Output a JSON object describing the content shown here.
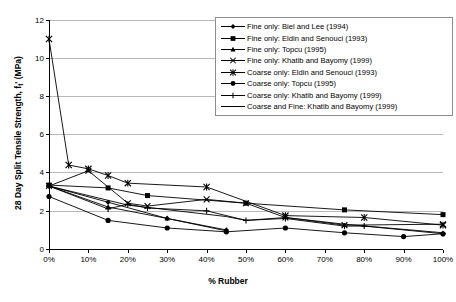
{
  "chart_data": {
    "type": "line",
    "title": "",
    "xlabel": "% Rubber",
    "ylabel": "28 Day Split Tensile Strength, ft' (MPa)",
    "ylabel_main": "28 Day Split Tensile Strength, f",
    "ylabel_sub": "t",
    "ylabel_tail": "' (MPa)",
    "xlim": [
      0,
      100
    ],
    "ylim": [
      0,
      12
    ],
    "xticks": [
      0,
      10,
      20,
      30,
      40,
      50,
      60,
      70,
      80,
      90,
      100
    ],
    "xtick_labels": [
      "0%",
      "10%",
      "20%",
      "30%",
      "40%",
      "50%",
      "60%",
      "70%",
      "80%",
      "90%",
      "100%"
    ],
    "yticks": [
      0,
      2,
      4,
      6,
      8,
      10,
      12
    ],
    "ytick_labels": [
      "0",
      "2",
      "4",
      "6",
      "8",
      "10",
      "12"
    ],
    "grid": "horizontal",
    "legend_position": "top-right",
    "series": [
      {
        "name": "Fine only: Biel and Lee (1994)",
        "marker": "diamond",
        "points": [
          [
            0,
            3.3
          ],
          [
            15,
            2.45
          ],
          [
            30,
            1.6
          ],
          [
            45,
            1.0
          ]
        ]
      },
      {
        "name": "Fine only: Eldin and Senouci (1993)",
        "marker": "square",
        "points": [
          [
            0,
            3.35
          ],
          [
            15,
            3.2
          ],
          [
            25,
            2.8
          ],
          [
            50,
            2.4
          ],
          [
            75,
            2.05
          ],
          [
            100,
            1.8
          ]
        ]
      },
      {
        "name": "Fine only: Topcu (1995)",
        "marker": "triangle",
        "points": [
          [
            0,
            3.3
          ],
          [
            15,
            2.2
          ],
          [
            30,
            1.6
          ],
          [
            45,
            0.95
          ]
        ]
      },
      {
        "name": "Fine only: Khatib and Bayomy (1999)",
        "marker": "x",
        "points": [
          [
            0,
            3.3
          ],
          [
            10,
            4.1
          ],
          [
            20,
            2.4
          ],
          [
            25,
            2.25
          ],
          [
            40,
            2.6
          ],
          [
            50,
            2.4
          ],
          [
            60,
            1.65
          ],
          [
            75,
            1.25
          ],
          [
            100,
            1.3
          ]
        ]
      },
      {
        "name": "Coarse only: Eldin and Senouci (1993)",
        "marker": "asterisk",
        "points": [
          [
            0,
            11.0
          ],
          [
            5,
            4.4
          ],
          [
            10,
            4.2
          ],
          [
            15,
            3.85
          ],
          [
            20,
            3.45
          ],
          [
            40,
            3.25
          ],
          [
            60,
            1.75
          ],
          [
            80,
            1.65
          ],
          [
            100,
            1.25
          ]
        ]
      },
      {
        "name": "Coarse only: Topcu (1995)",
        "marker": "circle",
        "points": [
          [
            0,
            2.75
          ],
          [
            15,
            1.5
          ],
          [
            30,
            1.1
          ],
          [
            45,
            0.9
          ],
          [
            60,
            1.1
          ],
          [
            75,
            0.85
          ],
          [
            90,
            0.65
          ],
          [
            100,
            0.8
          ]
        ]
      },
      {
        "name": "Coarse only: Khatib and Bayomy (1999)",
        "marker": "plus",
        "points": [
          [
            0,
            3.3
          ],
          [
            15,
            2.1
          ],
          [
            20,
            2.35
          ],
          [
            25,
            2.15
          ],
          [
            40,
            2.0
          ],
          [
            50,
            1.5
          ],
          [
            60,
            1.6
          ],
          [
            75,
            1.2
          ],
          [
            80,
            1.2
          ],
          [
            100,
            0.8
          ]
        ]
      },
      {
        "name": "Coarse and Fine: Khatib and Bayomy (1999)",
        "marker": "line",
        "points": [
          [
            0,
            3.3
          ],
          [
            20,
            2.3
          ],
          [
            45,
            1.7
          ],
          [
            50,
            1.5
          ],
          [
            60,
            1.65
          ],
          [
            75,
            1.3
          ],
          [
            100,
            0.85
          ]
        ]
      }
    ]
  }
}
